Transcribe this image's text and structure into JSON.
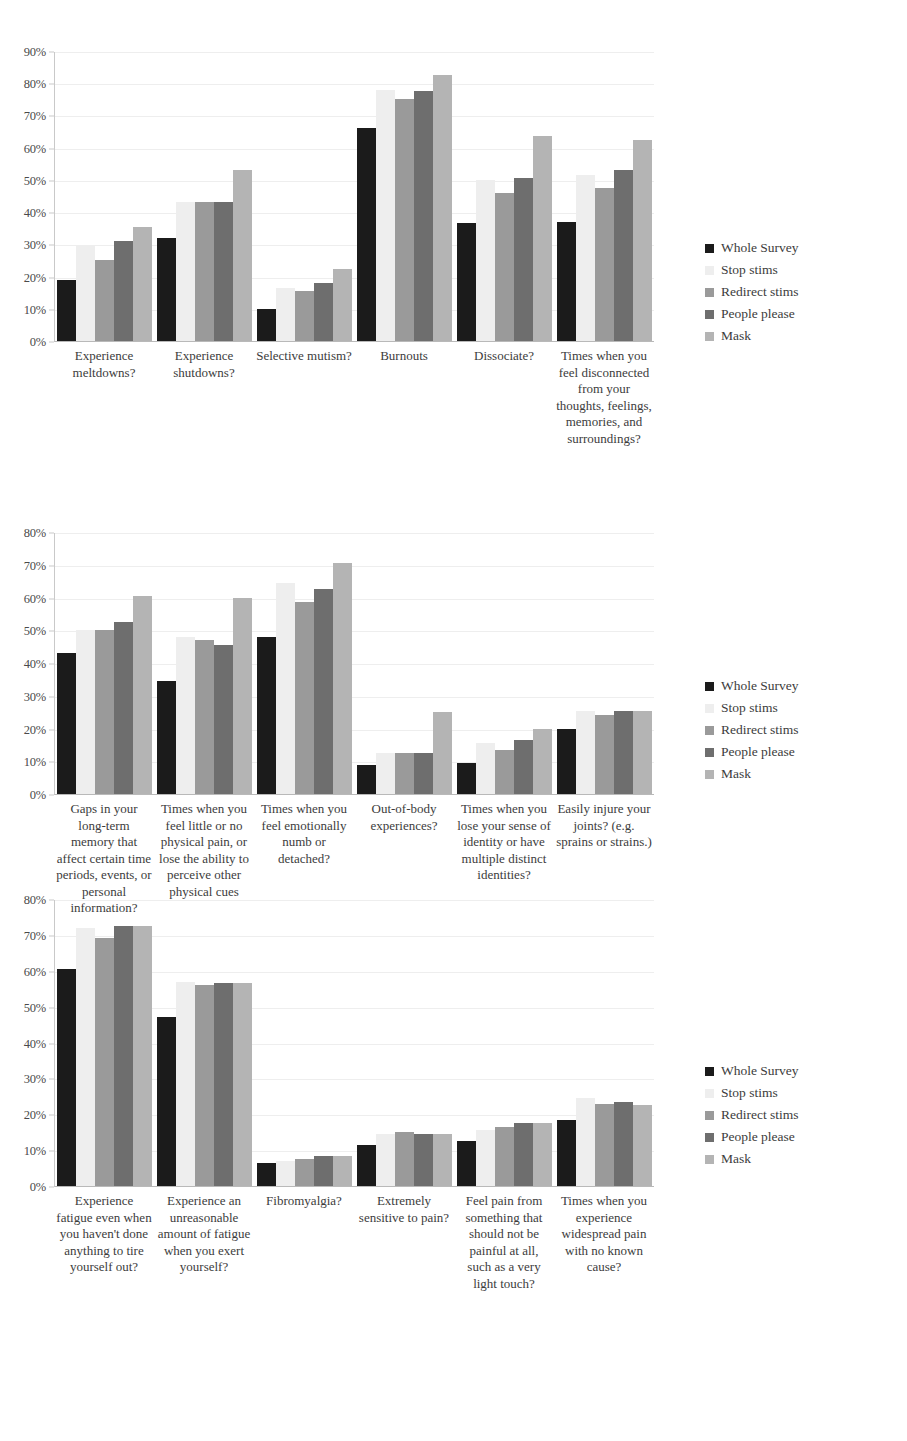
{
  "legend": {
    "entries": [
      {
        "label": "Whole Survey",
        "color": "#1b1b1b"
      },
      {
        "label": "Stop stims",
        "color": "#eeeeee"
      },
      {
        "label": "Redirect stims",
        "color": "#9a9a9a"
      },
      {
        "label": "People please",
        "color": "#6e6e6e"
      },
      {
        "label": "Mask",
        "color": "#b4b4b4"
      }
    ]
  },
  "chart_data": [
    {
      "type": "bar",
      "title": "",
      "xlabel": "",
      "ylabel": "",
      "ylim": [
        0,
        90
      ],
      "ytick_labels": [
        "0%",
        "10%",
        "20%",
        "30%",
        "40%",
        "50%",
        "60%",
        "70%",
        "80%",
        "90%"
      ],
      "ytick_values": [
        0,
        10,
        20,
        30,
        40,
        50,
        60,
        70,
        80,
        90
      ],
      "grid": true,
      "legend_position": "right",
      "categories": [
        "Experience meltdowns?",
        "Experience shutdowns?",
        "Selective mutism?",
        "Burnouts",
        "Dissociate?",
        "Times when you feel disconnected from your thoughts, feelings, memories, and surroundings?"
      ],
      "series": [
        {
          "name": "Whole Survey",
          "values": [
            19,
            32,
            10,
            66,
            36.5,
            37
          ]
        },
        {
          "name": "Stop stims",
          "values": [
            29.5,
            43,
            16.5,
            78,
            50,
            51.5
          ]
        },
        {
          "name": "Redirect stims",
          "values": [
            25,
            43,
            15.5,
            75,
            46,
            47.5
          ]
        },
        {
          "name": "People please",
          "values": [
            31,
            43,
            18,
            77.5,
            50.5,
            53
          ]
        },
        {
          "name": "Mask",
          "values": [
            35.5,
            53,
            22.5,
            82.5,
            63.5,
            62.5
          ]
        }
      ]
    },
    {
      "type": "bar",
      "title": "",
      "xlabel": "",
      "ylabel": "",
      "ylim": [
        0,
        80
      ],
      "ytick_labels": [
        "0%",
        "10%",
        "20%",
        "30%",
        "40%",
        "50%",
        "60%",
        "70%",
        "80%"
      ],
      "ytick_values": [
        0,
        10,
        20,
        30,
        40,
        50,
        60,
        70,
        80
      ],
      "grid": true,
      "legend_position": "right",
      "categories": [
        "Gaps in your long-term memory that affect certain time periods, events, or personal information?",
        "Times when you feel little or no physical pain, or lose the ability to perceive other physical cues",
        "Times when you feel emotionally numb or detached?",
        "Out-of-body experiences?",
        "Times when you lose your sense of identity or have multiple distinct identities?",
        "Easily injure your joints? (e.g. sprains or strains.)"
      ],
      "series": [
        {
          "name": "Whole Survey",
          "values": [
            43,
            34.5,
            48,
            9,
            9.5,
            20
          ]
        },
        {
          "name": "Stop stims",
          "values": [
            50,
            48,
            64.5,
            12.5,
            15.5,
            25.5
          ]
        },
        {
          "name": "Redirect stims",
          "values": [
            50,
            47,
            58.5,
            12.5,
            13.5,
            24
          ]
        },
        {
          "name": "People please",
          "values": [
            52.5,
            45.5,
            62.5,
            12.5,
            16.5,
            25.5
          ]
        },
        {
          "name": "Mask",
          "values": [
            60.5,
            60,
            70.5,
            25,
            20,
            25.5
          ]
        }
      ]
    },
    {
      "type": "bar",
      "title": "",
      "xlabel": "",
      "ylabel": "",
      "ylim": [
        0,
        80
      ],
      "ytick_labels": [
        "0%",
        "10%",
        "20%",
        "30%",
        "40%",
        "50%",
        "60%",
        "70%",
        "80%"
      ],
      "ytick_values": [
        0,
        10,
        20,
        30,
        40,
        50,
        60,
        70,
        80
      ],
      "grid": true,
      "legend_position": "right",
      "categories": [
        "Experience fatigue even when you haven't done anything to tire yourself out?",
        "Experience an unreasonable amount of fatigue when you exert yourself?",
        "Fibromyalgia?",
        "Extremely sensitive to pain?",
        "Feel pain from something that should not be painful at all, such as a very light touch?",
        "Times when you experience widespread pain with no known cause?"
      ],
      "series": [
        {
          "name": "Whole Survey",
          "values": [
            60.5,
            47,
            6.5,
            11.5,
            12.5,
            18.5
          ]
        },
        {
          "name": "Stop stims",
          "values": [
            72,
            57,
            7,
            14.5,
            15.5,
            24.5
          ]
        },
        {
          "name": "Redirect stims",
          "values": [
            69,
            56,
            7.5,
            15,
            16.5,
            23
          ]
        },
        {
          "name": "People please",
          "values": [
            72.5,
            56.5,
            8.5,
            14.5,
            17.5,
            23.5
          ]
        },
        {
          "name": "Mask",
          "values": [
            72.5,
            56.5,
            8.5,
            14.5,
            17.5,
            22.5
          ]
        }
      ]
    }
  ]
}
